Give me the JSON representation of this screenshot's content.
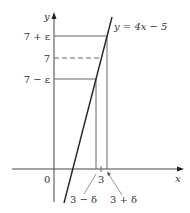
{
  "diagram": {
    "axes": {
      "x_label": "x",
      "y_label": "y",
      "origin_label": "0"
    },
    "curve": {
      "equation_label": "y = 4x − 5"
    },
    "y_levels": {
      "upper": "7 + ε",
      "center": "7",
      "lower": "7 − ε"
    },
    "x_levels": {
      "center": "3",
      "left": "3 − δ",
      "right": "3 + δ"
    },
    "colors": {
      "line": "#333333",
      "guide": "#555555"
    }
  }
}
